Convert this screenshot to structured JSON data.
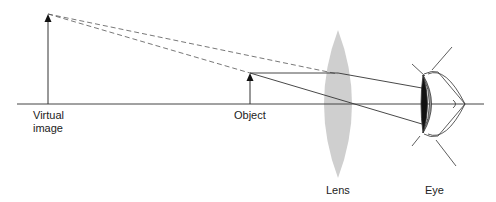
{
  "diagram": {
    "labels": {
      "virtual_image_line1": "Virtual",
      "virtual_image_line2": "image",
      "object": "Object",
      "lens": "Lens",
      "eye": "Eye"
    },
    "colors": {
      "lens_fill": "#cfcfcf",
      "line": "#333333",
      "background": "#ffffff"
    }
  }
}
